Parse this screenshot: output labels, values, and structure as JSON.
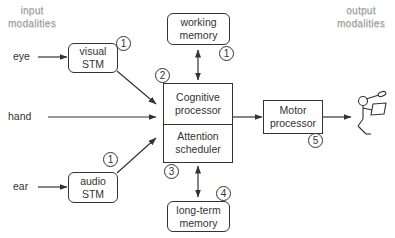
{
  "headers": {
    "input": [
      "input",
      "modalities"
    ],
    "output": [
      "output",
      "modalities"
    ]
  },
  "inputs": {
    "eye": "eye",
    "hand": "hand",
    "ear": "ear"
  },
  "boxes": {
    "visual_stm": [
      "visual",
      "STM"
    ],
    "audio_stm": [
      "audio",
      "STM"
    ],
    "working_memory": [
      "working",
      "memory"
    ],
    "long_term_memory": [
      "long-term",
      "memory"
    ],
    "cognitive_processor": [
      "Cognitive",
      "processor"
    ],
    "attention_scheduler": [
      "Attention",
      "scheduler"
    ],
    "motor_processor": [
      "Motor",
      "processor"
    ]
  },
  "badges": {
    "visual_stm": "1",
    "audio_stm": "1",
    "working_memory": "1",
    "cognitive": "2",
    "attention": "3",
    "long_term_memory": "4",
    "motor": "5"
  },
  "output_icon": "stick-figure-writing-icon",
  "colors": {
    "stroke": "#333333",
    "header_text": "#9a9a9a"
  }
}
